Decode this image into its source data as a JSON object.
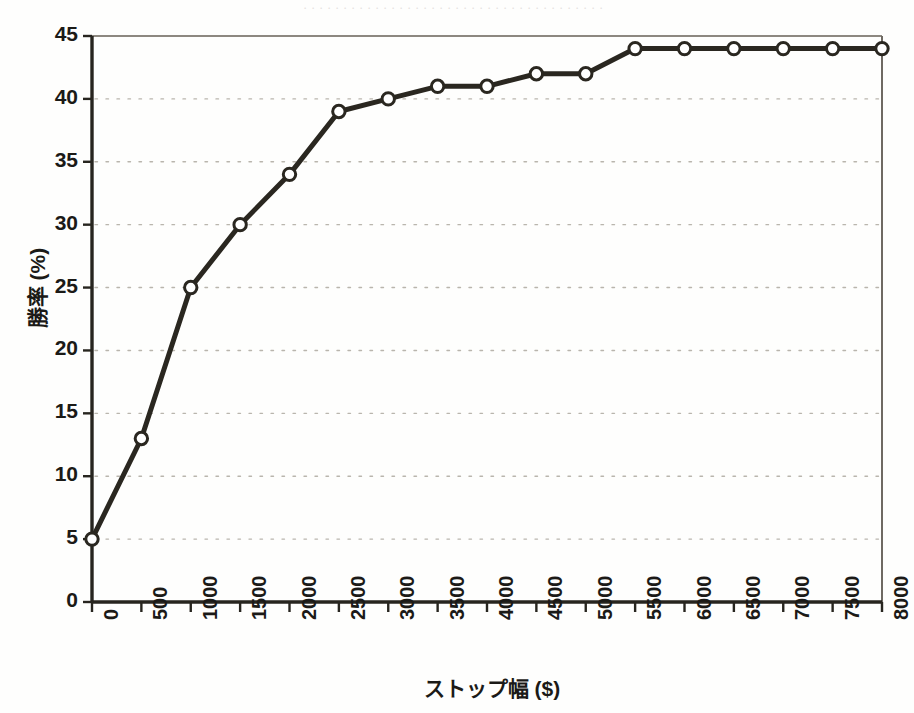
{
  "figure": {
    "caption_strip": "．．．．．．．．．．．．．．．．．．．．．．．．．．．．．．．．．．．．．．",
    "background_color": "#fefefd",
    "ink_color": "#1b1a17",
    "grid_color": "#b9b5ad",
    "marker_fill": "#ffffff"
  },
  "chart_data": {
    "type": "line",
    "title": "",
    "xlabel": "ストップ幅 ($)",
    "ylabel": "勝率 (%)",
    "xlim": [
      0,
      8000
    ],
    "ylim": [
      0,
      45
    ],
    "xticks": [
      0,
      500,
      1000,
      1500,
      2000,
      2500,
      3000,
      3500,
      4000,
      4500,
      5000,
      5500,
      6000,
      6500,
      7000,
      7500,
      8000
    ],
    "xtick_labels": [
      "0",
      "500",
      "1000",
      "1500",
      "2000",
      "2500",
      "3000",
      "3500",
      "4000",
      "4500",
      "5000",
      "5500",
      "6000",
      "6500",
      "7000",
      "7500",
      "8000"
    ],
    "yticks": [
      0,
      5,
      10,
      15,
      20,
      25,
      30,
      35,
      40,
      45
    ],
    "ytick_labels": [
      "0",
      "5",
      "10",
      "15",
      "20",
      "25",
      "30",
      "35",
      "40",
      "45"
    ],
    "grid": "horizontal-dotted",
    "legend": "none",
    "marker": "open-circle",
    "x": [
      0,
      500,
      1000,
      1500,
      2000,
      2500,
      3000,
      3500,
      4000,
      4500,
      5000,
      5500,
      6000,
      6500,
      7000,
      7500,
      8000
    ],
    "values": [
      5,
      13,
      25,
      30,
      34,
      39,
      40,
      41,
      41,
      42,
      42,
      44,
      44,
      44,
      44,
      44,
      44
    ],
    "series": [
      {
        "name": "勝率",
        "values": [
          5,
          13,
          25,
          30,
          34,
          39,
          40,
          41,
          41,
          42,
          42,
          44,
          44,
          44,
          44,
          44,
          44
        ]
      }
    ]
  }
}
